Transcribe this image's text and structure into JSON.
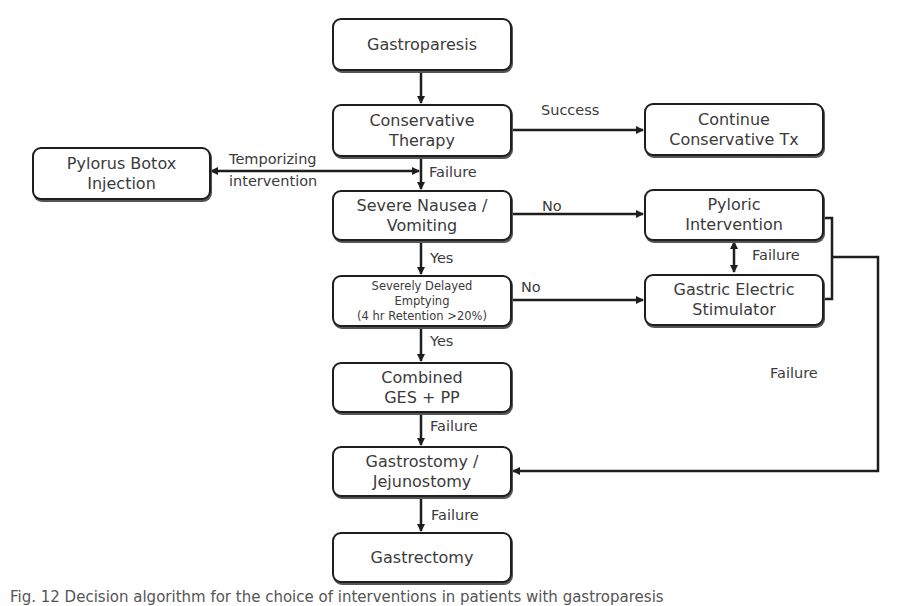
{
  "diagram": {
    "nodes": {
      "gastroparesis": {
        "lines": [
          "Gastroparesis"
        ]
      },
      "conservative_therapy": {
        "lines": [
          "Conservative",
          "Therapy"
        ]
      },
      "continue_conservative": {
        "lines": [
          "Continue",
          "Conservative Tx"
        ]
      },
      "pylorus_botox": {
        "lines": [
          "Pylorus Botox",
          "Injection"
        ]
      },
      "severe_nausea": {
        "lines": [
          "Severe Nausea /",
          "Vomiting"
        ]
      },
      "pyloric_intervention": {
        "lines": [
          "Pyloric",
          "Intervention"
        ]
      },
      "severely_delayed": {
        "lines": [
          "Severely Delayed",
          "Emptying",
          "(4 hr Retention >20%)"
        ]
      },
      "gastric_electric": {
        "lines": [
          "Gastric Electric",
          "Stimulator"
        ]
      },
      "combined": {
        "lines": [
          "Combined",
          "GES + PP"
        ]
      },
      "gastrostomy": {
        "lines": [
          "Gastrostomy /",
          "Jejunostomy"
        ]
      },
      "gastrectomy": {
        "lines": [
          "Gastrectomy"
        ]
      }
    },
    "edge_labels": {
      "success": "Success",
      "temporizing_1": "Temporizing",
      "temporizing_2": "intervention",
      "failure_conservative": "Failure",
      "no_nausea": "No",
      "yes_nausea": "Yes",
      "no_delayed": "No",
      "failure_pyloric_ges": "Failure",
      "yes_delayed": "Yes",
      "failure_right": "Failure",
      "failure_combined": "Failure",
      "failure_gastrostomy": "Failure"
    },
    "colors": {
      "stroke": "#1e1e1e",
      "text": "#3b3b3b",
      "background": "#ffffff"
    }
  },
  "caption": "Fig. 12  Decision algorithm for the choice of interventions in patients with gastroparesis"
}
